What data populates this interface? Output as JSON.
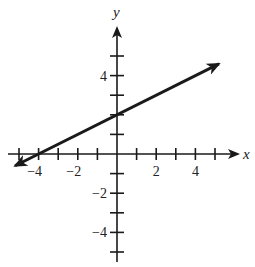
{
  "chart_data": {
    "type": "line",
    "title": "",
    "xlabel": "x",
    "ylabel": "y",
    "xlim": [
      -5,
      5
    ],
    "ylim": [
      -5,
      5
    ],
    "grid": false,
    "x_tick_labels": [
      {
        "value": -4,
        "label": "−4"
      },
      {
        "value": -2,
        "label": "−2"
      },
      {
        "value": 2,
        "label": "2"
      },
      {
        "value": 4,
        "label": "4"
      }
    ],
    "y_tick_labels": [
      {
        "value": 4,
        "label": "4"
      },
      {
        "value": -2,
        "label": "−2"
      },
      {
        "value": -4,
        "label": "−4"
      }
    ],
    "x_ticks": [
      -5,
      -4,
      -3,
      -2,
      -1,
      1,
      2,
      3,
      4,
      5
    ],
    "y_ticks": [
      -5,
      -4,
      -3,
      -2,
      -1,
      1,
      2,
      3,
      4,
      5
    ],
    "series": [
      {
        "name": "y = x/2 + 2",
        "slope": 0.5,
        "intercept": 2,
        "x": [
          -5.2,
          -4,
          0,
          5.2
        ],
        "y": [
          -0.6,
          0,
          2,
          4.6
        ],
        "arrows": "both",
        "color": "#1a1a1a"
      }
    ],
    "annotations": [
      {
        "label": "x-intercept",
        "x": -4,
        "y": 0
      },
      {
        "label": "y-intercept",
        "x": 0,
        "y": 2
      }
    ]
  },
  "colors": {
    "axis": "#1a1a1a",
    "line": "#1a1a1a",
    "background": "#ffffff"
  }
}
